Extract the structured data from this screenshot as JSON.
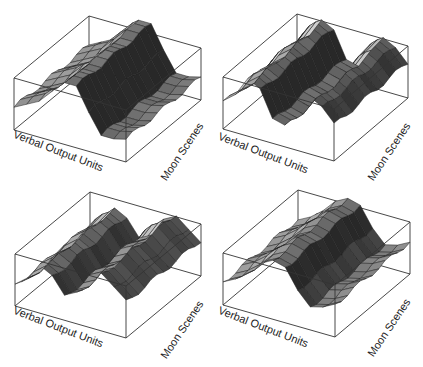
{
  "figure": {
    "panel_count": 4,
    "layout": "2x2 grid of 3D surface plots",
    "colors": {
      "background": "#ffffff",
      "box_line": "#333333",
      "mesh_line": "#1e1e1e",
      "surface_light": "#d8d8d8",
      "surface_dark": "#2e2e2e"
    }
  },
  "chart_data": [
    {
      "type": "surface",
      "panel": "top-left",
      "title": "",
      "xlabel": "Verbal Output Units",
      "ylabel": "Moon Scenes",
      "zlabel": "",
      "description": "Single ridge running across Moon Scenes, peaking mid Verbal Output Units",
      "x_profile": [
        0.35,
        0.45,
        0.55,
        0.75,
        0.95,
        0.95,
        0.6,
        0.3,
        0.3,
        0.35
      ],
      "y_steps": 12,
      "grid": false
    },
    {
      "type": "surface",
      "panel": "top-right",
      "title": "",
      "xlabel": "Verbal Output Units",
      "ylabel": "Moon Scenes",
      "zlabel": "",
      "description": "Two offset ridges forming an S-shaped twist",
      "x_profile": [
        0.4,
        0.55,
        0.85,
        0.75,
        0.35,
        0.3,
        0.6,
        0.85,
        0.75,
        0.55
      ],
      "y_steps": 12,
      "grid": false
    },
    {
      "type": "surface",
      "panel": "bottom-left",
      "title": "",
      "xlabel": "Verbal Output Units",
      "ylabel": "Moon Scenes",
      "zlabel": "",
      "description": "Stepped dark ridge at back-left, bright ridge on right side",
      "x_profile": [
        0.3,
        0.45,
        0.7,
        0.6,
        0.35,
        0.45,
        0.75,
        0.85,
        0.7,
        0.55
      ],
      "y_steps": 12,
      "grid": false
    },
    {
      "type": "surface",
      "panel": "bottom-right",
      "title": "",
      "xlabel": "Verbal Output Units",
      "ylabel": "Moon Scenes",
      "zlabel": "",
      "description": "Single ridge similar to top-left, slightly shifted",
      "x_profile": [
        0.35,
        0.45,
        0.6,
        0.8,
        0.9,
        0.85,
        0.55,
        0.35,
        0.4,
        0.5
      ],
      "y_steps": 12,
      "grid": false
    }
  ],
  "panels": [
    {
      "xlabel": "Verbal Output Units",
      "ylabel": "Moon Scenes"
    },
    {
      "xlabel": "Verbal Output Units",
      "ylabel": "Moon Scenes"
    },
    {
      "xlabel": "Verbal Output Units",
      "ylabel": "Moon Scenes"
    },
    {
      "xlabel": "Verbal Output Units",
      "ylabel": "Moon Scenes"
    }
  ]
}
